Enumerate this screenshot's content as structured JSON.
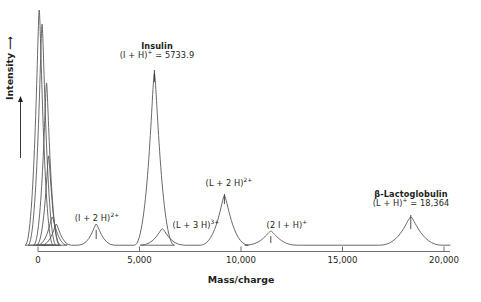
{
  "chart_data": {
    "type": "line",
    "title": "",
    "xlabel": "Mass/charge",
    "ylabel": "Intensity",
    "xlim": [
      0,
      20000
    ],
    "ylim": [
      0,
      100
    ],
    "grid": false,
    "legend": null,
    "x_ticks": [
      {
        "value": 0,
        "label": "0"
      },
      {
        "value": 5000,
        "label": "5,000"
      },
      {
        "value": 10000,
        "label": "10,000"
      },
      {
        "value": 15000,
        "label": "15,000"
      },
      {
        "value": 20000,
        "label": "20,000"
      }
    ],
    "y_axis_arrow": true,
    "y_ticks": [],
    "peaks": [
      {
        "id": "matrix-1",
        "mz": 60,
        "height": 100,
        "width": 28,
        "labeled": false
      },
      {
        "id": "matrix-2",
        "mz": 200,
        "height": 94,
        "width": 28,
        "labeled": false
      },
      {
        "id": "matrix-3",
        "mz": 420,
        "height": 69,
        "width": 26,
        "labeled": false
      },
      {
        "id": "matrix-4",
        "mz": 520,
        "height": 38,
        "width": 24,
        "labeled": false
      },
      {
        "id": "matrix-5",
        "mz": 700,
        "height": 12,
        "width": 30,
        "labeled": false
      },
      {
        "id": "matrix-6",
        "mz": 900,
        "height": 9,
        "width": 30,
        "labeled": false
      },
      {
        "id": "insulin-2plus",
        "mz": 2867,
        "height": 9,
        "width": 36,
        "labeled": true
      },
      {
        "id": "insulin-1plus",
        "mz": 5733.9,
        "height": 73,
        "width": 40,
        "labeled": true
      },
      {
        "id": "lactoglobulin-3plus",
        "mz": 6122,
        "height": 7,
        "width": 44,
        "labeled": true
      },
      {
        "id": "lactoglobulin-2plus",
        "mz": 9183,
        "height": 21,
        "width": 48,
        "labeled": true
      },
      {
        "id": "insulin-dimer",
        "mz": 11468,
        "height": 6,
        "width": 52,
        "labeled": true
      },
      {
        "id": "lactoglobulin-1plus",
        "mz": 18364,
        "height": 12,
        "width": 62,
        "labeled": true
      }
    ],
    "annotations": [
      {
        "id": "insulin-annotation",
        "name": "Insulin",
        "formula_prefix": "(I + H)",
        "formula_charge": "+",
        "formula_suffix": " = 5733.9",
        "mz": 5733.9
      },
      {
        "id": "insulin-2plus-annotation",
        "name": "",
        "formula_prefix": "(I + 2 H)",
        "formula_charge": "2+",
        "formula_suffix": "",
        "mz": 2867
      },
      {
        "id": "lactoglobulin-3plus-annotation",
        "name": "",
        "formula_prefix": "(L + 3 H)",
        "formula_charge": "3+",
        "formula_suffix": "",
        "mz": 6122
      },
      {
        "id": "lactoglobulin-2plus-annotation",
        "name": "",
        "formula_prefix": "(L + 2 H)",
        "formula_charge": "2+",
        "formula_suffix": "",
        "mz": 9183
      },
      {
        "id": "insulin-dimer-annotation",
        "name": "",
        "formula_prefix": "(2 I + H)",
        "formula_charge": "+",
        "formula_suffix": "",
        "mz": 11468
      },
      {
        "id": "lactoglobulin-annotation",
        "name": "β-Lactoglobulin",
        "formula_prefix": "(L + H)",
        "formula_charge": "+",
        "formula_suffix": " = 18,364",
        "mz": 18364
      }
    ],
    "trace_color": "#58595b",
    "axis_color": "#6d6e71",
    "text_color": "#231f20"
  },
  "labels": {
    "insulin_name": "Insulin",
    "insulin_formula_pre": "(I + H)",
    "insulin_formula_sup": "+",
    "insulin_formula_post": " = 5733.9",
    "lacto_name": "β-Lactoglobulin",
    "lacto_formula_pre": "(L + H)",
    "lacto_formula_sup": "+",
    "lacto_formula_post": " = 18,364",
    "ins2_pre": "(I + 2 H)",
    "ins2_sup": "2+",
    "lac3_pre": "(L + 3 H)",
    "lac3_sup": "3+",
    "lac2_pre": "(L + 2 H)",
    "lac2_sup": "2+",
    "dimer_pre": "(2 I + H)",
    "dimer_sup": "+",
    "x_axis_title": "Mass/charge",
    "y_axis_title": "Intensity ⟶",
    "tick_0": "0",
    "tick_5000": "5,000",
    "tick_10000": "10,000",
    "tick_15000": "15,000",
    "tick_20000": "20,000"
  }
}
